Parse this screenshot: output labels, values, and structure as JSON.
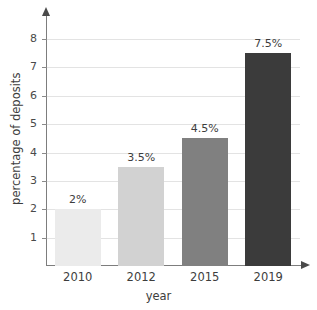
{
  "chart_data": {
    "type": "bar",
    "title": "",
    "subtitle": "",
    "xlabel": "year",
    "ylabel": "percentage of deposits",
    "categories": [
      "2010",
      "2012",
      "2015",
      "2019"
    ],
    "values": [
      2,
      3.5,
      4.5,
      7.5
    ],
    "value_labels": [
      "2%",
      "3.5%",
      "4.5%",
      "7.5%"
    ],
    "bar_colors": [
      "#ebebeb",
      "#d2d2d2",
      "#808080",
      "#3b3b3b"
    ],
    "ylim": [
      0,
      8.6
    ],
    "y_ticks": [
      1,
      2,
      3,
      4,
      5,
      6,
      7,
      8
    ],
    "y_tick_labels": [
      "1",
      "2",
      "3",
      "4",
      "5",
      "6",
      "7",
      "8"
    ],
    "grid": true,
    "grid_axis": "y",
    "legend": false,
    "legend_position": "none",
    "axis_arrows": true,
    "background_color": "#ffffff",
    "grid_color": "#e3e3e3",
    "axis_color": "#7d7d7d",
    "text_color": "#3d3d3d"
  }
}
